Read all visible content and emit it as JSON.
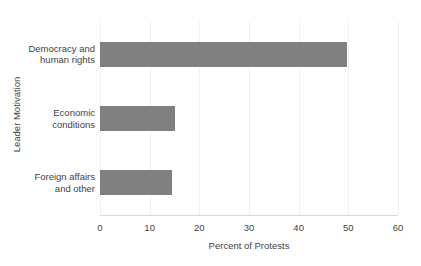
{
  "chart_data": {
    "type": "bar",
    "orientation": "horizontal",
    "title": "",
    "xlabel": "Percent of Protests",
    "ylabel": "Leader Motivation",
    "categories": [
      "Democracy and human rights",
      "Economic conditions",
      "Foreign affairs and other"
    ],
    "category_lines": [
      [
        "Democracy and",
        "human rights"
      ],
      [
        "Economic",
        "conditions"
      ],
      [
        "Foreign affairs",
        "and other"
      ]
    ],
    "values": [
      49.8,
      15.1,
      14.4
    ],
    "xlim": [
      0,
      60
    ],
    "xticks": [
      0,
      10,
      20,
      30,
      40,
      50,
      60
    ],
    "xtick_labels": [
      "0",
      "10",
      "20",
      "30",
      "40",
      "50",
      "60"
    ],
    "grid": "vertical",
    "legend": "none",
    "bar_color": "#808080",
    "gridline_color": "#f0f0f0",
    "axis_color": "#d8d8d8",
    "text_color": "#3f3f3f",
    "background": "#ffffff"
  }
}
